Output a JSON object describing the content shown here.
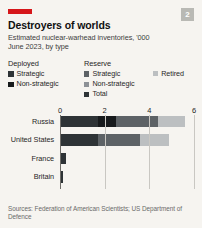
{
  "header": {
    "badge": "2",
    "title": "Destroyers of worlds",
    "subtitle_line1": "Estimated nuclear-warhead inventories, '000",
    "subtitle_line2": "June 2023, by type",
    "rule_color": "#d6161a"
  },
  "legend": {
    "groups": [
      {
        "heading": "Deployed",
        "items": [
          {
            "label": "Strategic",
            "color": "#2e3336"
          },
          {
            "label": "Non-strategic",
            "color": "#171a1c"
          }
        ]
      },
      {
        "heading": "Reserve",
        "items": [
          {
            "label": "Strategic",
            "color": "#5d6266"
          },
          {
            "label": "Non-strategic",
            "color": "#8d9196"
          },
          {
            "label": "Total",
            "color": "#2e3336"
          }
        ]
      }
    ],
    "extra": [
      {
        "label": "Retired",
        "color": "#bcbfc1"
      }
    ]
  },
  "sources": "Sources: Federation of American Scientists; US Department of Defence",
  "chart_data": {
    "type": "bar",
    "orientation": "horizontal",
    "stacked": true,
    "title": "Destroyers of worlds",
    "subtitle": "Estimated nuclear-warhead inventories, '000 — June 2023, by type",
    "xlabel": "",
    "ylabel": "",
    "xlim": [
      0,
      6
    ],
    "ticks": [
      0,
      2,
      4,
      6
    ],
    "tick_labels": [
      "0",
      "2",
      "4",
      "6"
    ],
    "grid": true,
    "legend_position": "top",
    "categories": [
      "Russia",
      "United States",
      "France",
      "Britain"
    ],
    "series": [
      {
        "name": "Deployed strategic",
        "color": "#2e3336",
        "values": [
          1.7,
          1.7,
          0.28,
          0.12
        ]
      },
      {
        "name": "Deployed non-strategic",
        "color": "#171a1c",
        "values": [
          0.8,
          0.0,
          0.0,
          0.0
        ]
      },
      {
        "name": "Reserve strategic",
        "color": "#5d6266",
        "values": [
          1.9,
          1.9,
          0.0,
          0.0
        ]
      },
      {
        "name": "Reserve non-strategic",
        "color": "#8d9196",
        "values": [
          0.0,
          0.0,
          0.0,
          0.0
        ]
      },
      {
        "name": "Retired",
        "color": "#bcbfc1",
        "values": [
          1.2,
          1.3,
          0.0,
          0.0
        ]
      }
    ],
    "totals": [
      5.6,
      4.9,
      0.29,
      0.23
    ]
  }
}
